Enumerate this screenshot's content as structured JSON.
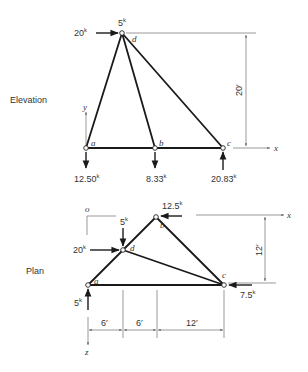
{
  "elevation": {
    "title": "Elevation",
    "joints": {
      "a": {
        "label": "a",
        "x": 86,
        "y": 148
      },
      "b": {
        "label": "b",
        "x": 155,
        "y": 148
      },
      "c": {
        "label": "c",
        "x": 223,
        "y": 148
      },
      "d": {
        "label": "d",
        "x": 122,
        "y": 33
      }
    },
    "loads": {
      "horizontal_at_d": {
        "value": "20",
        "unit": "k"
      },
      "vertical_at_d": {
        "value": "5",
        "unit": "k"
      }
    },
    "reactions": {
      "a": {
        "value": "12.50",
        "unit": "k",
        "direction": "down"
      },
      "b": {
        "value": "8.33",
        "unit": "k",
        "direction": "down"
      },
      "c": {
        "value": "20.83",
        "unit": "k",
        "direction": "up"
      }
    },
    "dimension_height": "20",
    "dimension_unit": "′",
    "axes": {
      "x": "x",
      "y": "y"
    }
  },
  "plan": {
    "title": "Plan",
    "origin_label": "o",
    "joints": {
      "a": {
        "label": "a",
        "x": 88,
        "y": 285
      },
      "b": {
        "label": "b",
        "x": 156,
        "y": 217
      },
      "c": {
        "label": "c",
        "x": 224,
        "y": 285
      },
      "d": {
        "label": "d",
        "x": 123,
        "y": 250
      }
    },
    "loads": {
      "at_b": {
        "value": "12.5",
        "unit": "k"
      },
      "at_d_vertical": {
        "value": "5",
        "unit": "k"
      },
      "at_d_horizontal": {
        "value": "20",
        "unit": "k"
      },
      "at_a": {
        "value": "5",
        "unit": "k"
      },
      "at_c": {
        "value": "7.5",
        "unit": "k"
      }
    },
    "dimension_depth": "12",
    "dimensions_horizontal": [
      "6",
      "6",
      "12"
    ],
    "dimension_unit": "′",
    "axes": {
      "x": "x",
      "z": "z"
    }
  }
}
